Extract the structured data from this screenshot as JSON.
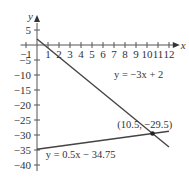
{
  "chart_data": {
    "type": "line",
    "title": "",
    "xlabel": "x",
    "ylabel": "y",
    "xlim": [
      -1.5,
      12.8
    ],
    "ylim": [
      -42,
      8
    ],
    "grid": false,
    "x_ticks": [
      -1,
      1,
      2,
      3,
      4,
      5,
      6,
      7,
      8,
      9,
      10,
      11,
      12
    ],
    "x_tick_labels": [
      "−1",
      "1",
      "2",
      "3",
      "4",
      "5",
      "6",
      "7",
      "8",
      "9",
      "10",
      "11",
      "12"
    ],
    "y_ticks": [
      5,
      -5,
      -10,
      -15,
      -20,
      -25,
      -30,
      -35,
      -40
    ],
    "y_tick_labels": [
      "5",
      "−5",
      "−10",
      "−15",
      "−20",
      "−25",
      "−30",
      "−35",
      "−40"
    ],
    "series": [
      {
        "name": "y = −3x + 2",
        "slope": -3,
        "intercept": 2,
        "x_range": [
          0,
          12
        ],
        "color": "#444444"
      },
      {
        "name": "y = 0.5x − 34.75",
        "slope": 0.5,
        "intercept": -34.75,
        "x_range": [
          0,
          12
        ],
        "color": "#444444"
      }
    ],
    "annotations": [
      {
        "text": "y = −3x + 2",
        "x": 7,
        "y": -11
      },
      {
        "text": "y = 0.5x − 34.75",
        "x": 0.8,
        "y": -37.5
      },
      {
        "text": "(10.5, −29.5)",
        "x": 7.3,
        "y": -27.5
      }
    ],
    "intersection": {
      "x": 10.5,
      "y": -29.5,
      "label": "(10.5, −29.5)"
    }
  }
}
